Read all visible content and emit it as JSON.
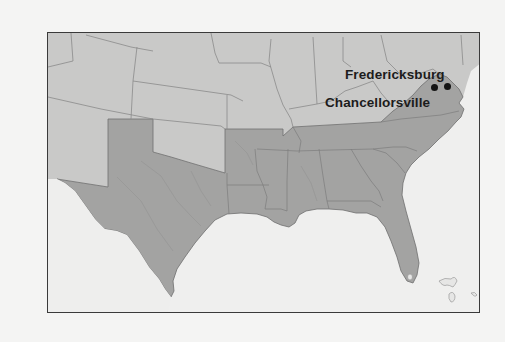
{
  "map": {
    "region": "Southern and Central United States (Civil War era)",
    "colors": {
      "page_background": "#f4f4f3",
      "water": "#efefee",
      "union_states": "#c9c9c8",
      "confederate_states": "#a3a3a2",
      "state_borders": "#7d7d7d",
      "frame_border": "#3a3a3a",
      "city_marker": "#141414",
      "label_text": "#1c1c1c"
    },
    "legend_groups": [
      {
        "name": "Confederate states",
        "shade": "dark gray"
      },
      {
        "name": "Union states and territories",
        "shade": "light gray"
      }
    ],
    "locations": [
      {
        "name": "Fredericksburg",
        "marker": "black dot"
      },
      {
        "name": "Chancellorsville",
        "marker": "black dot"
      }
    ]
  },
  "labels": {
    "fredericksburg": "Fredericksburg",
    "chancellorsville": "Chancellorsville"
  }
}
